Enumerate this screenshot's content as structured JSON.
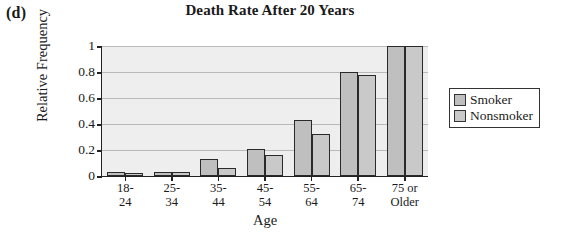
{
  "panel_label": "(d)",
  "chart_data": {
    "type": "bar",
    "title": "Death Rate After 20 Years",
    "xlabel": "Age",
    "ylabel": "Relative Frequency",
    "categories": [
      "18-24",
      "25-34",
      "35-44",
      "45-54",
      "55-64",
      "65-74",
      "75 or\nOlder"
    ],
    "series": [
      {
        "name": "Smoker",
        "values": [
          0.03,
          0.03,
          0.13,
          0.21,
          0.43,
          0.8,
          1.0
        ],
        "color": "#bfbfbf"
      },
      {
        "name": "Nonsmoker",
        "values": [
          0.02,
          0.03,
          0.06,
          0.16,
          0.32,
          0.78,
          1.0
        ],
        "color": "#c9c9c9"
      }
    ],
    "ylim": [
      0,
      1
    ],
    "yticks": [
      0,
      0.2,
      0.4,
      0.6,
      0.8,
      1
    ],
    "ytick_labels": [
      "0",
      "0.2",
      "0.4",
      "0.6",
      "0.8",
      "1"
    ],
    "grid": true,
    "legend_position": "right",
    "plot_background": "#eeeeee"
  }
}
